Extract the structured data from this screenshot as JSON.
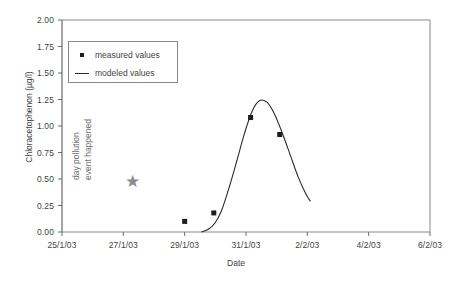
{
  "chart_data": {
    "type": "scatter",
    "title": "",
    "xlabel": "Date",
    "ylabel": "Chloracetophenon (µg/l)",
    "ylim": [
      0.0,
      2.0
    ],
    "yticks": [
      "0.00",
      "0.25",
      "0.50",
      "0.75",
      "1.00",
      "1.25",
      "1.50",
      "1.75",
      "2.00"
    ],
    "ytick_values": [
      0.0,
      0.25,
      0.5,
      0.75,
      1.0,
      1.25,
      1.5,
      1.75,
      2.0
    ],
    "xticks": [
      "25/1/03",
      "27/1/03",
      "29/1/03",
      "31/1/03",
      "2/2/03",
      "4/2/03",
      "6/2/03"
    ],
    "xtick_days": [
      0,
      2,
      4,
      6,
      8,
      10,
      12
    ],
    "xlim_days": [
      0,
      12
    ],
    "grid": false,
    "legend_position": "upper-left-inside",
    "series": [
      {
        "name": "measured  values",
        "type": "scatter",
        "marker": "square",
        "color": "#1c1c1c",
        "x_days": [
          4.0,
          4.95,
          6.15,
          7.1
        ],
        "x_labels": [
          "29/1/03",
          "30/1/03",
          "31/1/03",
          "1/2/03"
        ],
        "values": [
          0.1,
          0.18,
          1.08,
          0.92
        ]
      },
      {
        "name": "modeled  values",
        "type": "line",
        "color": "#2a2a2a",
        "x_days": [
          4.55,
          4.8,
          5.0,
          5.2,
          5.45,
          5.7,
          5.95,
          6.2,
          6.45,
          6.7,
          6.95,
          7.2,
          7.45,
          7.7,
          7.95,
          8.1
        ],
        "values": [
          0.0,
          0.03,
          0.09,
          0.2,
          0.42,
          0.67,
          0.93,
          1.14,
          1.24,
          1.22,
          1.1,
          0.92,
          0.72,
          0.52,
          0.36,
          0.29
        ]
      }
    ],
    "annotations": [
      {
        "name": "pollution-event",
        "text_lines": [
          "day pollution",
          "event happened"
        ],
        "marker": "star",
        "marker_color": "#8c8c8c",
        "x_days": 2.3,
        "value": 0.45,
        "rotation": -90
      }
    ]
  }
}
